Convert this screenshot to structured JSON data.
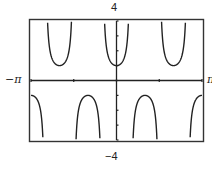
{
  "chart_data": {
    "type": "line",
    "title": "",
    "function": "y = sec(3x)",
    "xlabel": "",
    "ylabel": "",
    "xlim": [
      -3.14159,
      3.14159
    ],
    "ylim": [
      -4,
      4
    ],
    "x_range_labels": {
      "left": "−π",
      "right": "π"
    },
    "y_range_labels": {
      "top": "4",
      "bottom": "−4"
    },
    "x_ticks": [
      -3.14159,
      -1.5708,
      0,
      1.5708,
      3.14159
    ],
    "y_ticks": [
      -4,
      -3,
      -2,
      -1,
      0,
      1,
      2,
      3,
      4
    ],
    "grid": false,
    "legend": null,
    "series": [
      {
        "name": "sec(3x)",
        "color": "#222222",
        "branches": [
          {
            "type": "upper",
            "x_center": -3.14159,
            "min_y": 1,
            "partial": "right"
          },
          {
            "type": "lower",
            "x_center": -2.0944,
            "max_y": -1
          },
          {
            "type": "upper",
            "x_center": -1.0472,
            "min_y": 1
          },
          {
            "type": "lower",
            "x_center": 0,
            "max_y": -1
          },
          {
            "type": "upper",
            "x_center": 1.0472,
            "min_y": 1
          },
          {
            "type": "lower",
            "x_center": 2.0944,
            "max_y": -1
          },
          {
            "type": "upper",
            "x_center": 3.14159,
            "min_y": 1,
            "partial": "left"
          }
        ]
      }
    ]
  },
  "labels": {
    "top": "4",
    "bottom": "−4",
    "left": "−π",
    "right": "π"
  },
  "style": {
    "line_color": "#222222",
    "frame_color": "#333333",
    "background": "#ffffff"
  }
}
